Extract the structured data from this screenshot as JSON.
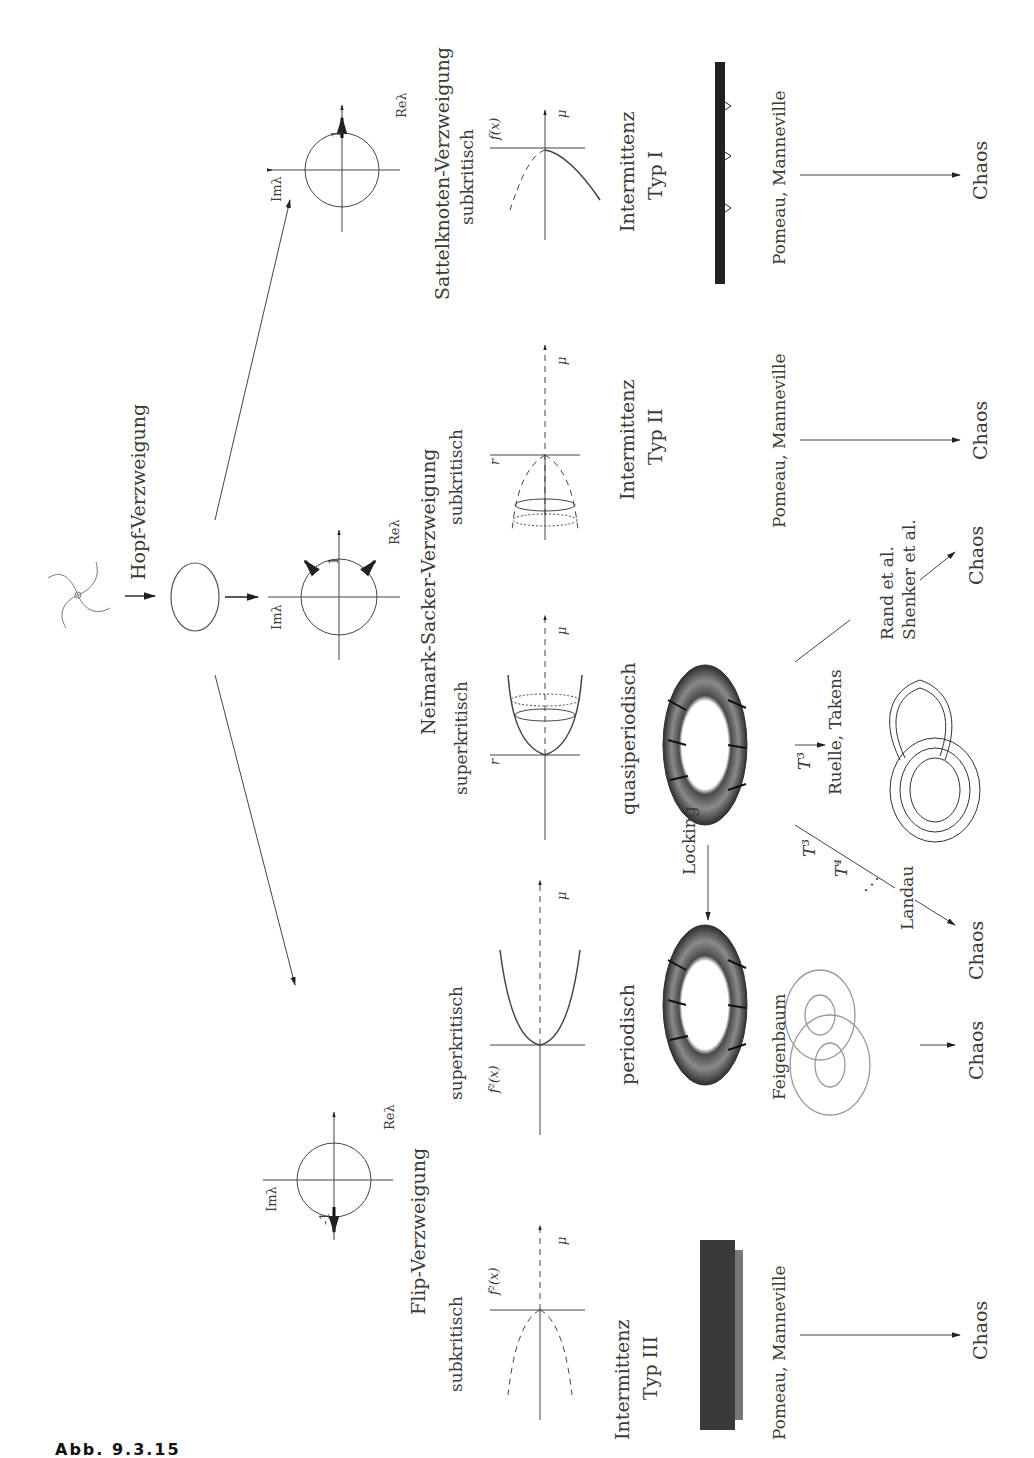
{
  "figure": {
    "orientation": "rotated 90 degrees counter-clockwise",
    "caption_partial": "Abb. 9.3.15"
  },
  "top": {
    "start": "Fixpunkt (Spiralfokus)",
    "hopf_label": "Hopf-Verzweigung",
    "eigen_axes": {
      "re": "Reλ",
      "im": "Imλ",
      "unit": "1",
      "minus_unit": "-1"
    }
  },
  "branches": {
    "flip": {
      "title": "Flip-Verzweigung",
      "sub": {
        "label": "subkritisch",
        "yaxis": "f²(x)",
        "xaxis": "μ",
        "type_line1": "Intermittenz",
        "type_line2": "Typ III",
        "authors": "Pomeau, Manneville",
        "result": "Chaos"
      },
      "super": {
        "label": "superkritisch",
        "yaxis": "f²(x)",
        "xaxis": "μ",
        "state": "periodisch",
        "authors": "Feigenbaum",
        "result": "Chaos"
      }
    },
    "neimark": {
      "title": "Neĭmark-Sacker-Verzweigung",
      "super": {
        "label": "superkritisch",
        "yaxis": "r",
        "xaxis": "μ",
        "state": "quasiperiodisch",
        "locking": "Locking",
        "t3": "T³",
        "t4": "T⁴",
        "dots": "⋱",
        "landau": "Landau",
        "landau_result": "Chaos",
        "ruelle": "Ruelle, Takens",
        "rand_line1": "Rand et al.",
        "rand_line2": "Shenker et al.",
        "rand_result": "Chaos"
      },
      "sub": {
        "label": "subkritisch",
        "yaxis": "r",
        "xaxis": "μ",
        "type_line1": "Intermittenz",
        "type_line2": "Typ II",
        "authors": "Pomeau, Manneville",
        "result": "Chaos"
      }
    },
    "saddle": {
      "title": "Sattelknoten-Verzweigung",
      "sub": {
        "label": "subkritisch",
        "yaxis": "f(x)",
        "xaxis": "μ",
        "type_line1": "Intermittenz",
        "type_line2": "Typ I",
        "authors": "Pomeau, Manneville",
        "result": "Chaos"
      }
    }
  },
  "colors": {
    "ink": "#333333",
    "torus_dark": "#3a3a3a",
    "torus_light": "#9a9a9a",
    "line": "#555555"
  }
}
